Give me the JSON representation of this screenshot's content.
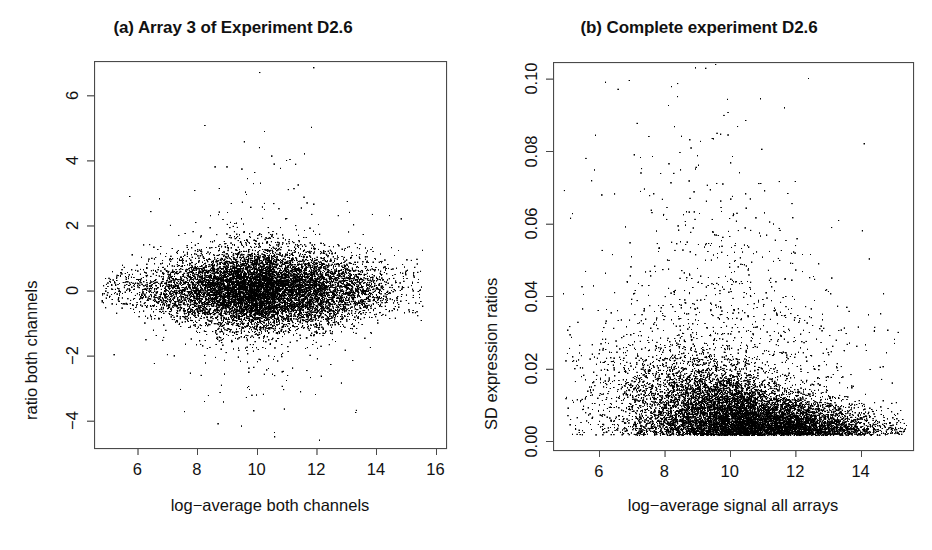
{
  "figure": {
    "background": "#ffffff",
    "foreground": "#111111",
    "point_color": "#000000"
  },
  "chart_data": [
    {
      "id": "panel-a",
      "type": "scatter",
      "title": "(a) Array 3 of Experiment D2.6",
      "xlabel": "log−average both channels",
      "ylabel": "ratio both channels",
      "xlim": [
        4.55,
        16.35
      ],
      "ylim": [
        -4.85,
        7.05
      ],
      "xticks": [
        6,
        8,
        10,
        12,
        14,
        16
      ],
      "xtick_labels": [
        "6",
        "8",
        "10",
        "12",
        "14",
        "16"
      ],
      "yticks": [
        -4,
        -2,
        0,
        2,
        4,
        6
      ],
      "ytick_labels": [
        "−4",
        "−2",
        "0",
        "2",
        "4",
        "6"
      ],
      "grid": false,
      "legend": "none",
      "frame": true,
      "point_size_px": 1.3,
      "n_points": 11000,
      "description": "MA-style cloud: log-ratio centred near 0, spread narrowing at low signal, broad dense lobe between x=8 and x=14, sparse outliers up to ratio 6.7 and down to -4.6",
      "distribution": {
        "kind": "ma-plot-cloud",
        "x_mode": 10.6,
        "x_sd": 1.85,
        "x_min": 4.8,
        "x_max": 15.6,
        "y_center": 0.02,
        "y_sd_base": 0.42,
        "y_sd_peak": 0.62,
        "y_sd_peak_x": 10.4,
        "outlier_fraction": 0.035,
        "outlier_sd_multiplier": 3.2
      },
      "notable_points": [
        {
          "x": 10.1,
          "y": 6.7
        },
        {
          "x": 11.0,
          "y": 4.0
        },
        {
          "x": 11.6,
          "y": 4.2
        },
        {
          "x": 8.6,
          "y": 3.8
        },
        {
          "x": 9.0,
          "y": 3.8
        },
        {
          "x": 9.9,
          "y": -3.7
        },
        {
          "x": 8.7,
          "y": -4.1
        },
        {
          "x": 10.6,
          "y": -4.5
        },
        {
          "x": 12.1,
          "y": -4.6
        }
      ]
    },
    {
      "id": "panel-b",
      "type": "scatter",
      "title": "(b) Complete experiment D2.6",
      "xlabel": "log−average signal all arrays",
      "ylabel": "SD expression ratios",
      "xlim": [
        4.6,
        15.6
      ],
      "ylim": [
        -0.0025,
        0.1045
      ],
      "xticks": [
        6,
        8,
        10,
        12,
        14
      ],
      "xtick_labels": [
        "6",
        "8",
        "10",
        "12",
        "14"
      ],
      "yticks": [
        0.0,
        0.02,
        0.04,
        0.06,
        0.08,
        0.1
      ],
      "ytick_labels": [
        "0.00",
        "0.02",
        "0.04",
        "0.06",
        "0.08",
        "0.10"
      ],
      "grid": false,
      "legend": "none",
      "frame": true,
      "point_size_px": 1.3,
      "n_points": 11000,
      "description": "SD vs signal: heavy dense mass hugging SD=0 baseline for x>9, long sparse tail of high-SD points scattered over full x-range up to 0.10 (clipped)",
      "distribution": {
        "kind": "sd-vs-signal",
        "x_mode": 10.8,
        "x_sd": 1.8,
        "x_min": 4.9,
        "x_max": 15.4,
        "sd_floor": 0.0016,
        "sd_scale_low_x": 0.03,
        "sd_scale_high_x": 0.0055,
        "sd_decay_x0": 9.2,
        "sd_decay_width": 1.7,
        "tail_fraction": 0.12,
        "tail_scale": 0.045,
        "clip_max": 0.1045
      },
      "notable_points": [
        {
          "x": 6.2,
          "y": 0.099
        },
        {
          "x": 12.4,
          "y": 0.1
        },
        {
          "x": 8.4,
          "y": 0.095
        },
        {
          "x": 14.1,
          "y": 0.082
        },
        {
          "x": 5.6,
          "y": 0.078
        }
      ]
    }
  ],
  "panels": [
    {
      "title": "(a) Array 3 of Experiment D2.6",
      "xlabel": "log−average both channels",
      "ylabel": "ratio both channels"
    },
    {
      "title": "(b) Complete experiment D2.6",
      "xlabel": "log−average signal all arrays",
      "ylabel": "SD expression ratios"
    }
  ]
}
